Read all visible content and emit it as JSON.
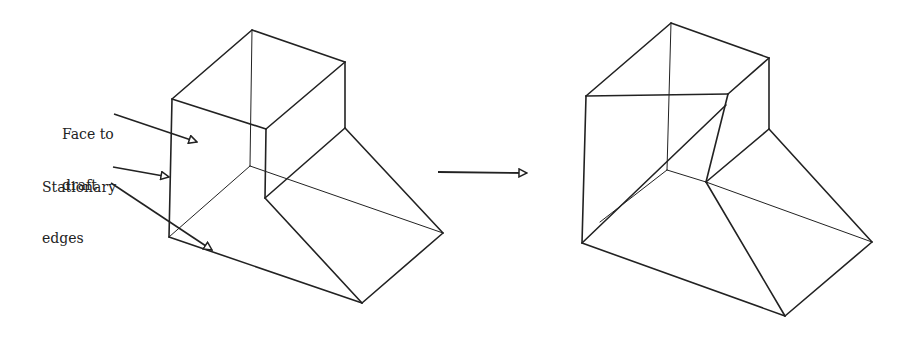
{
  "labels": {
    "face_to_draft_line1": "Face to",
    "face_to_draft_line2": "draft",
    "stationary_line1": "Stationary",
    "stationary_line2": "edges"
  },
  "figures": {
    "before": "Original solid with face to draft",
    "after": "Solid after draft applied"
  },
  "colors": {
    "line": "#222222",
    "background": "#ffffff"
  }
}
